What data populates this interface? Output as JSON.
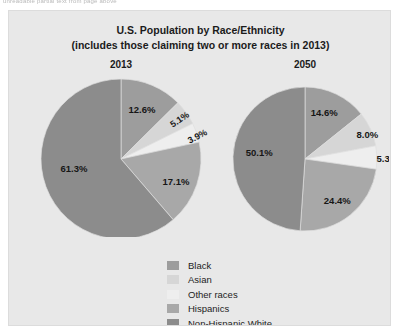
{
  "scan_artifact": {
    "top_strip_text": "unreadable partial text from page above"
  },
  "chart_title": {
    "line1": "U.S. Population by Race/Ethnicity",
    "line2": "(includes those claiming two or more races in 2013)"
  },
  "legend": {
    "items": [
      {
        "label": "Black",
        "color": "#9d9d9d"
      },
      {
        "label": "Asian",
        "color": "#d6d6d6"
      },
      {
        "label": "Other races",
        "color": "#eeeeee"
      },
      {
        "label": "Hispanics",
        "color": "#a8a8a8"
      },
      {
        "label": "Non-Hispanic White",
        "color": "#8c8c8c"
      }
    ]
  },
  "panels": [
    {
      "year": "2013"
    },
    {
      "year": "2050"
    }
  ],
  "chart_data": {
    "type": "pie",
    "title": "U.S. Population by Race/Ethnicity (includes those claiming two or more races in 2013)",
    "legend_position": "bottom-center",
    "value_unit": "percent",
    "categories": [
      "Black",
      "Asian",
      "Other races",
      "Hispanics",
      "Non-Hispanic White"
    ],
    "colors": [
      "#9d9d9d",
      "#d6d6d6",
      "#eeeeee",
      "#a8a8a8",
      "#8c8c8c"
    ],
    "charts": [
      {
        "title": "2013",
        "labels": [
          "12.6%",
          "5.1%",
          "3.9%",
          "17.1%",
          "61.3%"
        ],
        "values": [
          12.6,
          5.1,
          3.9,
          17.1,
          61.3
        ]
      },
      {
        "title": "2050",
        "labels": [
          "14.6%",
          "8.0%",
          "5.3%",
          "24.4%",
          "50.1%"
        ],
        "values": [
          14.6,
          8.0,
          5.3,
          24.4,
          50.1
        ]
      }
    ]
  }
}
